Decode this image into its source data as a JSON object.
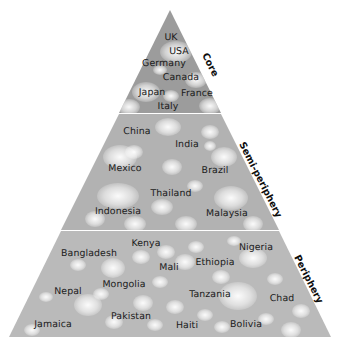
{
  "diagram": {
    "colors": {
      "core_fill": "#9e9e9e",
      "semi_fill": "#b0b0b0",
      "periphery_fill": "#b8b8b8",
      "blob": "#ececec",
      "label_text": "#1a1a1a",
      "background": "#ffffff"
    },
    "tiers": [
      {
        "name": "core",
        "label": "Core",
        "countries": [
          {
            "name": "UK",
            "x": 171,
            "y": 37
          },
          {
            "name": "USA",
            "x": 179,
            "y": 51
          },
          {
            "name": "Germany",
            "x": 164,
            "y": 63
          },
          {
            "name": "Canada",
            "x": 181,
            "y": 77
          },
          {
            "name": "Japan",
            "x": 152,
            "y": 92
          },
          {
            "name": "France",
            "x": 197,
            "y": 93
          },
          {
            "name": "Italy",
            "x": 168,
            "y": 106
          }
        ]
      },
      {
        "name": "semi-periphery",
        "label": "Semi-periphery",
        "countries": [
          {
            "name": "China",
            "x": 137,
            "y": 131
          },
          {
            "name": "India",
            "x": 187,
            "y": 144
          },
          {
            "name": "Mexico",
            "x": 125,
            "y": 168
          },
          {
            "name": "Brazil",
            "x": 215,
            "y": 170
          },
          {
            "name": "Thailand",
            "x": 171,
            "y": 193
          },
          {
            "name": "Indonesia",
            "x": 118,
            "y": 211
          },
          {
            "name": "Malaysia",
            "x": 227,
            "y": 213
          }
        ]
      },
      {
        "name": "periphery",
        "label": "Periphery",
        "countries": [
          {
            "name": "Kenya",
            "x": 146,
            "y": 243
          },
          {
            "name": "Nigeria",
            "x": 256,
            "y": 247
          },
          {
            "name": "Bangladesh",
            "x": 89,
            "y": 253
          },
          {
            "name": "Ethiopia",
            "x": 215,
            "y": 262
          },
          {
            "name": "Mali",
            "x": 169,
            "y": 267
          },
          {
            "name": "Mongolia",
            "x": 124,
            "y": 284
          },
          {
            "name": "Nepal",
            "x": 68,
            "y": 291
          },
          {
            "name": "Tanzania",
            "x": 210,
            "y": 294
          },
          {
            "name": "Chad",
            "x": 282,
            "y": 298
          },
          {
            "name": "Pakistan",
            "x": 131,
            "y": 316
          },
          {
            "name": "Jamaica",
            "x": 53,
            "y": 324
          },
          {
            "name": "Haiti",
            "x": 187,
            "y": 325
          },
          {
            "name": "Bolivia",
            "x": 246,
            "y": 324
          }
        ]
      }
    ]
  }
}
